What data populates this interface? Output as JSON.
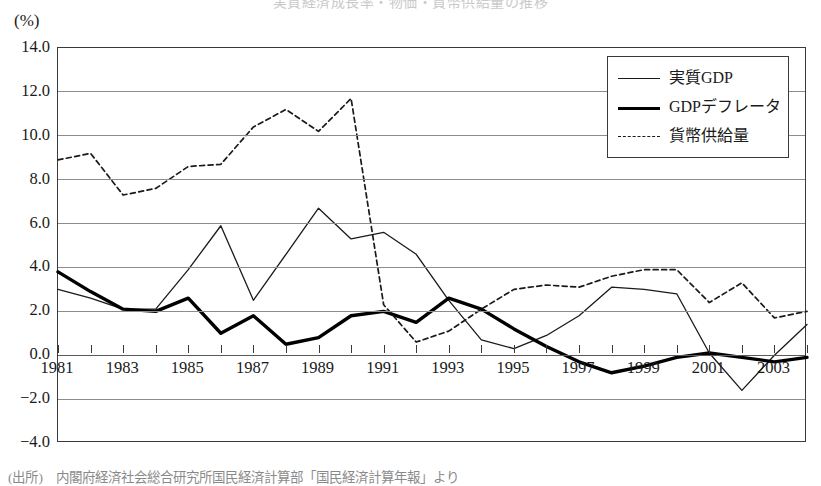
{
  "chart_data": {
    "type": "line",
    "title": "実質経済成長率・物価・貨幣供給量の推移",
    "unit_label": "(%)",
    "xlabel": "",
    "ylabel": "",
    "grid": true,
    "legend_position": "top-right",
    "ylim": [
      -4.0,
      14.0
    ],
    "yticks": [
      "14.0",
      "12.0",
      "10.0",
      "8.0",
      "6.0",
      "4.0",
      "2.0",
      "0.0",
      "-2.0",
      "-4.0"
    ],
    "ytick_values": [
      14.0,
      12.0,
      10.0,
      8.0,
      6.0,
      4.0,
      2.0,
      0.0,
      -2.0,
      -4.0
    ],
    "xlim": [
      1981,
      2004
    ],
    "x": [
      1981,
      1982,
      1983,
      1984,
      1985,
      1986,
      1987,
      1988,
      1989,
      1990,
      1991,
      1992,
      1993,
      1994,
      1995,
      1996,
      1997,
      1998,
      1999,
      2000,
      2001,
      2002,
      2003,
      2004
    ],
    "xticks": [
      "1981",
      "1983",
      "1985",
      "1987",
      "1989",
      "1991",
      "1993",
      "1995",
      "1997",
      "1999",
      "2001",
      "2003"
    ],
    "xtick_values": [
      1981,
      1983,
      1985,
      1987,
      1989,
      1991,
      1993,
      1995,
      1997,
      1999,
      2001,
      2003
    ],
    "series": [
      {
        "name": "実質GDP",
        "style": "thin-solid",
        "color": "#1a1a1a",
        "values": [
          3.0,
          2.6,
          2.1,
          2.1,
          3.9,
          5.9,
          2.5,
          4.6,
          6.7,
          5.3,
          5.6,
          4.6,
          2.5,
          0.7,
          0.3,
          0.9,
          1.8,
          3.1,
          3.0,
          2.8,
          0.1,
          -1.6,
          0.0,
          1.4
        ]
      },
      {
        "name": "GDPデフレータ",
        "style": "thick-solid",
        "color": "#000000",
        "values": [
          3.8,
          2.9,
          2.1,
          2.0,
          2.6,
          1.0,
          1.8,
          0.5,
          0.8,
          1.8,
          2.0,
          1.5,
          2.6,
          2.1,
          1.2,
          0.4,
          -0.3,
          -0.8,
          -0.5,
          -0.1,
          0.1,
          -0.1,
          -0.3,
          -0.1
        ]
      },
      {
        "name": "貨幣供給量",
        "style": "dashed",
        "color": "#1a1a1a",
        "values": [
          8.9,
          9.2,
          7.3,
          7.6,
          8.6,
          8.7,
          10.4,
          11.2,
          10.2,
          11.7,
          2.3,
          0.6,
          1.1,
          2.1,
          3.0,
          3.2,
          3.1,
          3.6,
          3.9,
          3.9,
          2.4,
          3.3,
          1.7,
          2.0
        ]
      }
    ],
    "series_points": {
      "実質GDP": [
        [
          1981,
          3.0
        ],
        [
          1982,
          2.6
        ],
        [
          1983,
          2.1
        ],
        [
          1984,
          2.1
        ],
        [
          1985,
          3.9
        ],
        [
          1986,
          5.9
        ],
        [
          1987,
          2.5
        ],
        [
          1988,
          4.6
        ],
        [
          1989,
          6.7
        ],
        [
          1990,
          5.3
        ],
        [
          1991,
          5.6
        ],
        [
          1992,
          4.6
        ],
        [
          1993,
          2.5
        ],
        [
          1994,
          0.7
        ],
        [
          1995,
          0.3
        ],
        [
          1996,
          0.9
        ],
        [
          1997,
          1.8
        ],
        [
          1998,
          3.1
        ],
        [
          1999,
          3.0
        ],
        [
          2000,
          2.8
        ],
        [
          2001,
          0.1
        ],
        [
          2002,
          -1.6
        ],
        [
          2003,
          0.0
        ],
        [
          2004,
          1.4
        ]
      ],
      "GDPデフレータ": [
        [
          1981,
          3.8
        ],
        [
          1982,
          2.9
        ],
        [
          1983,
          2.1
        ],
        [
          1984,
          2.0
        ],
        [
          1985,
          2.6
        ],
        [
          1986,
          1.0
        ],
        [
          1987,
          1.8
        ],
        [
          1988,
          0.5
        ],
        [
          1989,
          0.8
        ],
        [
          1990,
          1.8
        ],
        [
          1991,
          2.0
        ],
        [
          1992,
          1.5
        ],
        [
          1993,
          2.6
        ],
        [
          1994,
          2.1
        ],
        [
          1995,
          1.2
        ],
        [
          1996,
          0.4
        ],
        [
          1997,
          -0.3
        ],
        [
          1998,
          -0.8
        ],
        [
          1999,
          -0.5
        ],
        [
          2000,
          -0.1
        ],
        [
          2001,
          0.1
        ],
        [
          2002,
          -0.1
        ],
        [
          2003,
          -0.3
        ],
        [
          2004,
          -0.1
        ]
      ],
      "貨幣供給量": [
        [
          1981,
          8.9
        ],
        [
          1982,
          9.2
        ],
        [
          1983,
          7.3
        ],
        [
          1984,
          7.6
        ],
        [
          1985,
          8.6
        ],
        [
          1986,
          8.7
        ],
        [
          1987,
          10.4
        ],
        [
          1988,
          11.2
        ],
        [
          1989,
          10.2
        ],
        [
          1990,
          11.7
        ],
        [
          1991,
          2.3
        ],
        [
          1992,
          0.6
        ],
        [
          1993,
          1.1
        ],
        [
          1994,
          2.1
        ],
        [
          1995,
          3.0
        ],
        [
          1996,
          3.2
        ],
        [
          1997,
          3.1
        ],
        [
          1998,
          3.6
        ],
        [
          1999,
          3.9
        ],
        [
          2000,
          3.9
        ],
        [
          2001,
          2.4
        ],
        [
          2002,
          3.3
        ],
        [
          2003,
          1.7
        ],
        [
          2004,
          2.0
        ]
      ]
    }
  },
  "legend": {
    "items": [
      {
        "label": "実質GDP",
        "style": "thin-solid"
      },
      {
        "label": "GDPデフレータ",
        "style": "thick-solid"
      },
      {
        "label": "貨幣供給量",
        "style": "dashed"
      }
    ]
  },
  "source": {
    "note": "(出所)　内閣府経済社会総合研究所国民経済計算部「国民経済計算年報」より"
  },
  "colors": {
    "axis": "#3a3a3a",
    "grid": "#8c8c8c",
    "real_gdp": "#1a1a1a",
    "deflator": "#000000",
    "money_supply": "#1a1a1a",
    "background": "#ffffff"
  }
}
